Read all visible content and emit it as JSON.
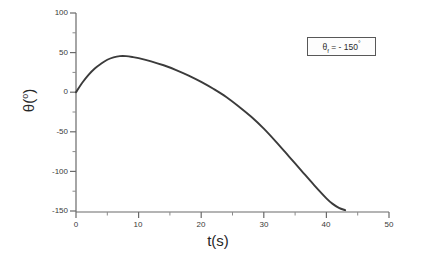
{
  "chart_data": {
    "type": "line",
    "title": "",
    "xlabel": "t(s)",
    "ylabel": "θ(°)",
    "xlim": [
      0,
      50
    ],
    "ylim": [
      -150,
      100
    ],
    "xticks": [
      "0",
      "10",
      "20",
      "30",
      "40",
      "50"
    ],
    "yticks": [
      "100",
      "50",
      "0",
      "-50",
      "-100",
      "-150"
    ],
    "xtick_values": [
      0,
      10,
      20,
      30,
      40,
      50
    ],
    "ytick_values": [
      100,
      50,
      0,
      -50,
      -100,
      -150
    ],
    "grid": false,
    "minor_ticks": true,
    "legend": "none",
    "annotations": [
      {
        "text": "θf = - 150°",
        "symbol": "θ",
        "subscript": "f",
        "equals": "= - 150",
        "degree": "°",
        "boxed": true
      }
    ],
    "series": [
      {
        "name": "theta(t)",
        "color": "#3b3b3b",
        "x": [
          0,
          1,
          2,
          3,
          4,
          5,
          6,
          7,
          8,
          9,
          10,
          12,
          14,
          16,
          18,
          20,
          22,
          24,
          26,
          28,
          30,
          32,
          34,
          36,
          38,
          40,
          41,
          42,
          43
        ],
        "y": [
          0,
          12,
          22,
          30,
          36,
          41,
          44,
          45.5,
          45.5,
          44.5,
          43,
          39,
          34,
          28,
          21,
          13,
          4,
          -6,
          -18,
          -31,
          -46,
          -63,
          -81,
          -99,
          -117,
          -134,
          -141,
          -146,
          -149
        ]
      }
    ]
  },
  "axes": {
    "y_axis_name": "theta-axis",
    "x_axis_name": "time-axis"
  }
}
